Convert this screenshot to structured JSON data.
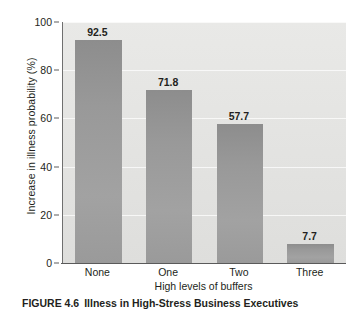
{
  "chart_data": {
    "type": "bar",
    "title": "",
    "categories": [
      "None",
      "One",
      "Two",
      "Three"
    ],
    "values": [
      92.5,
      71.8,
      57.7,
      7.7
    ],
    "value_labels": [
      "92.5",
      "71.8",
      "57.7",
      "7.7"
    ],
    "xlabel": "High levels of buffers",
    "ylabel": "Increase in illness probability (%)",
    "ylim": [
      0,
      100
    ],
    "yticks": [
      0,
      20,
      40,
      60,
      80,
      100
    ],
    "ytick_labels": [
      "0",
      "20",
      "40",
      "60",
      "80",
      "100"
    ],
    "grid": true,
    "legend": null,
    "orientation": "vertical",
    "bar_color": "#9a9a9a",
    "plot_background": "#e5e5e3"
  },
  "caption": {
    "figure_number": "FIGURE 4.6",
    "text": "Illness in High-Stress Business Executives"
  }
}
